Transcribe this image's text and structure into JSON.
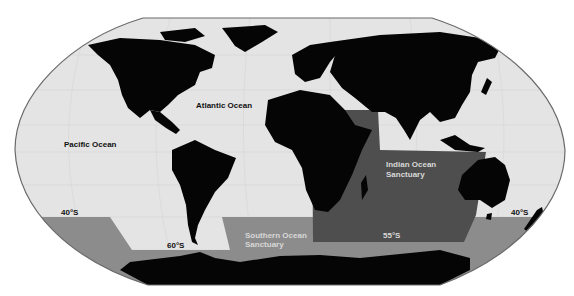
{
  "map": {
    "colors": {
      "ocean": "#e4e4e4",
      "land": "#050505",
      "southern_sanctuary": "#8c8c8c",
      "indian_sanctuary": "#4e4e4e",
      "border": "#6a6a6a",
      "background": "#ffffff"
    },
    "labels": {
      "atlantic": "Atlantic Ocean",
      "pacific": "Pacific Ocean",
      "indian_sanctuary_line1": "Indian Ocean",
      "indian_sanctuary_line2": "Sanctuary",
      "southern_sanctuary_line1": "Southern Ocean",
      "southern_sanctuary_line2": "Sanctuary",
      "lat_40s_west": "40°S",
      "lat_60s": "60°S",
      "lat_55s": "55°S",
      "lat_40s_east": "40°S"
    }
  }
}
